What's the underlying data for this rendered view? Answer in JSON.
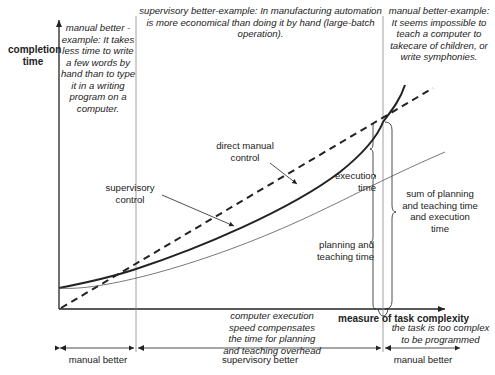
{
  "axes": {
    "y_label": "completion time",
    "x_label": "measure of task complexity"
  },
  "regions_top": [
    {
      "title": "manual better -example:",
      "text": "It takes less time to write a few words by hand than to type it in a writing program on a computer."
    },
    {
      "title": "supervisory better-example:",
      "text": "In manufacturing automation is more economical than doing it by hand (large-batch operation)."
    },
    {
      "title": "manual better-example:",
      "text": "It seems impossible to teach a computer to takecare of children, or write symphonies."
    }
  ],
  "curve_labels": {
    "direct_manual": "direct manual control",
    "supervisory": "supervisory control",
    "execution": "execution time",
    "planning": "planning and teaching time",
    "sum": "sum of planning and teaching time and execution time"
  },
  "below_axis_notes": {
    "middle": "computer execution speed compensates the time for planning and teaching overhead",
    "right": "the task is too complex to be programmed"
  },
  "bottom_ranges": [
    {
      "label": "manual better"
    },
    {
      "label": "supervisory better"
    },
    {
      "label": "manual better"
    }
  ],
  "colors": {
    "line": "#222222",
    "thin_line": "#555555",
    "divider": "#888888"
  }
}
